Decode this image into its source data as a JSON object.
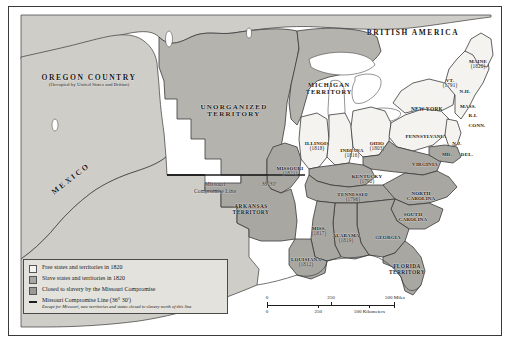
{
  "map": {
    "title": "Missouri Compromise 1820",
    "colors": {
      "free_state_fill": "#f4f3f0",
      "slave_state_fill": "#a9a7a2",
      "closed_to_slavery_fill": "#9b9995",
      "unorganized_fill": "#b5b3ae",
      "land_neutral_fill": "#cfcdc8",
      "water_fill": "#ffffff",
      "border_line": "#3a3a3a",
      "compromise_line": "#1d1d1d",
      "legend_background": "#e4e2dd",
      "text": "#161616"
    },
    "regions": [
      {
        "name": "OREGON COUNTRY",
        "sub": "(Occupied by United States and Britian)",
        "x": 80,
        "y": 78
      },
      {
        "name": "UNORGANIZED TERRITORY",
        "x": 225,
        "y": 105
      },
      {
        "name": "MICHIGAN TERRITORY",
        "x": 317,
        "y": 84
      },
      {
        "name": "BRITISH AMERICA",
        "x": 400,
        "y": 30
      },
      {
        "name": "MEXICO",
        "x": 60,
        "y": 170
      },
      {
        "name": "ARKANSAS TERRITORY",
        "x": 240,
        "y": 203
      },
      {
        "name": "FLORIDA TERRITORY",
        "x": 398,
        "y": 262
      }
    ],
    "states": [
      {
        "name": "MAINE",
        "year": "(1820)",
        "x": 467,
        "y": 59
      },
      {
        "name": "VT.",
        "year": "(1791)",
        "x": 441,
        "y": 78
      },
      {
        "name": "N.H.",
        "x": 455,
        "y": 85
      },
      {
        "name": "NEW YORK",
        "x": 420,
        "y": 103
      },
      {
        "name": "MASS.",
        "x": 458,
        "y": 100
      },
      {
        "name": "R.I.",
        "x": 462,
        "y": 109
      },
      {
        "name": "CONN.",
        "x": 466,
        "y": 118
      },
      {
        "name": "PENNSYLVANIA",
        "x": 419,
        "y": 131
      },
      {
        "name": "N.J.",
        "x": 447,
        "y": 136
      },
      {
        "name": "MD.",
        "x": 440,
        "y": 147
      },
      {
        "name": "DEL.",
        "x": 457,
        "y": 147
      },
      {
        "name": "VIRGINIA",
        "x": 416,
        "y": 158
      },
      {
        "name": "OHIO",
        "year": "(1803)",
        "x": 369,
        "y": 141
      },
      {
        "name": "INDIANA",
        "year": "(1816)",
        "x": 344,
        "y": 146
      },
      {
        "name": "ILLINOIS",
        "year": "(1818)",
        "x": 311,
        "y": 140
      },
      {
        "name": "MISSOURI",
        "year": "(1821)",
        "x": 285,
        "y": 165
      },
      {
        "name": "KENTUCKY",
        "year": "(1792)",
        "x": 361,
        "y": 174
      },
      {
        "name": "TENNESSEE",
        "year": "(1796)",
        "x": 347,
        "y": 192
      },
      {
        "name": "NORTH CAROLINA",
        "x": 412,
        "y": 190
      },
      {
        "name": "SOUTH CAROLINA",
        "x": 405,
        "y": 210
      },
      {
        "name": "GEORGIA",
        "x": 381,
        "y": 231
      },
      {
        "name": "ALABAMA",
        "year": "(1819)",
        "x": 338,
        "y": 232
      },
      {
        "name": "MISS.",
        "year": "(1817)",
        "x": 311,
        "y": 225
      },
      {
        "name": "LOUISIANA",
        "year": "(1812)",
        "x": 299,
        "y": 256
      }
    ],
    "annotations": [
      {
        "name": "compromise-line-label",
        "line1": "Missouri",
        "line2": "Compromise Line",
        "x": 206,
        "y": 181
      },
      {
        "name": "latitude-label",
        "text": "36°30'",
        "x": 259,
        "y": 180
      }
    ]
  },
  "legend": {
    "items": [
      {
        "swatch": "free",
        "label": "Free states and territories in 1820"
      },
      {
        "swatch": "slave",
        "label": "Slave states and territories in 1820"
      },
      {
        "swatch": "closed",
        "label": "Closed to slavery by the Missouri Compromise"
      },
      {
        "swatch": "line",
        "label": "Missouri Compromise Line (36° 30')",
        "note": "Except for Missouri, new territories and states closed to slavery north of this line"
      }
    ]
  },
  "scalebar": {
    "miles": {
      "labels": [
        "0",
        "250",
        "500 Miles"
      ],
      "positions": [
        0,
        50,
        100
      ]
    },
    "kilometers": {
      "labels": [
        "0",
        "250",
        "500 Kilometers"
      ],
      "positions": [
        0,
        40,
        80
      ]
    }
  }
}
